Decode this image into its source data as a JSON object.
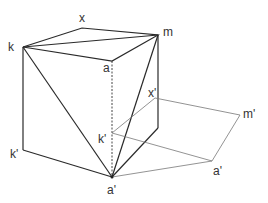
{
  "diagram": {
    "type": "geometry-3d-projection",
    "labels": {
      "x": "x",
      "m": "m",
      "k": "k",
      "a": "a",
      "k_prime_left": "k'",
      "x_prime": "x'",
      "m_prime": "m'",
      "k_prime_inner": "k'",
      "a_prime_right": "a'",
      "a_prime_bottom": "a'"
    },
    "colors": {
      "edge": "#2a2a2a",
      "projection": "#777777",
      "label": "#333333"
    }
  }
}
